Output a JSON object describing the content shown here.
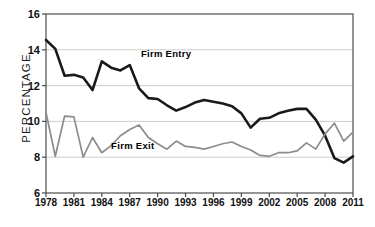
{
  "chart_data": {
    "type": "line",
    "title": "",
    "xlabel": "",
    "ylabel": "PERCENTAGE",
    "xlim": [
      1978,
      2011
    ],
    "ylim": [
      6,
      16
    ],
    "yticks": [
      6,
      8,
      10,
      12,
      14,
      16
    ],
    "xticks": [
      1978,
      1981,
      1984,
      1987,
      1990,
      1993,
      1996,
      1999,
      2002,
      2005,
      2008,
      2011
    ],
    "grid": "horizontal",
    "legend": "inline-labels",
    "x": [
      1978,
      1979,
      1980,
      1981,
      1982,
      1983,
      1984,
      1985,
      1986,
      1987,
      1988,
      1989,
      1990,
      1991,
      1992,
      1993,
      1994,
      1995,
      1996,
      1997,
      1998,
      1999,
      2000,
      2001,
      2002,
      2003,
      2004,
      2005,
      2006,
      2007,
      2008,
      2009,
      2010,
      2011
    ],
    "series": [
      {
        "name": "Firm Entry",
        "color": "#1a1a1a",
        "width": 2.6,
        "values": [
          14.55,
          14.05,
          12.55,
          12.6,
          12.45,
          11.75,
          13.35,
          13.0,
          12.85,
          13.15,
          11.85,
          11.3,
          11.25,
          10.9,
          10.6,
          10.8,
          11.05,
          11.2,
          11.1,
          11.0,
          10.85,
          10.45,
          9.65,
          10.15,
          10.2,
          10.45,
          10.6,
          10.7,
          10.7,
          10.1,
          9.2,
          7.95,
          7.7,
          8.05
        ]
      },
      {
        "name": "Firm Exit",
        "color": "#8c8c8c",
        "width": 1.7,
        "values": [
          10.5,
          8.05,
          10.3,
          10.25,
          8.0,
          9.1,
          8.25,
          8.65,
          9.2,
          9.55,
          9.8,
          9.1,
          8.75,
          8.45,
          8.9,
          8.6,
          8.55,
          8.45,
          8.6,
          8.75,
          8.85,
          8.6,
          8.4,
          8.1,
          8.05,
          8.25,
          8.25,
          8.35,
          8.8,
          8.45,
          9.3,
          9.9,
          8.9,
          9.4
        ]
      }
    ],
    "annotations": [
      {
        "text": "Firm Entry",
        "x": 1988.2,
        "y": 13.75
      },
      {
        "text": "Firm Exit",
        "x": 1985.0,
        "y": 8.62
      }
    ]
  },
  "axis": {
    "y_tick_labels": [
      "16",
      "14",
      "12",
      "10",
      "8",
      "6"
    ],
    "x_tick_labels": [
      "1978",
      "1981",
      "1984",
      "1987",
      "1990",
      "1993",
      "1996",
      "1999",
      "2002",
      "2005",
      "2008",
      "2011"
    ]
  },
  "colors": {
    "entry": "#1a1a1a",
    "exit": "#8c8c8c",
    "grid": "#cccccc",
    "axis": "#4d4d4d",
    "text": "#111111",
    "background": "#ffffff"
  }
}
